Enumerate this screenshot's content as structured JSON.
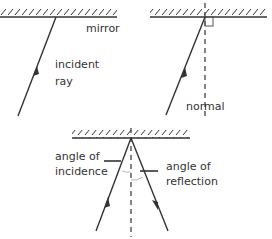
{
  "diagram": {
    "panel1": {
      "mirror_label": "mirror",
      "ray_label_line1": "incident",
      "ray_label_line2": "ray"
    },
    "panel2": {
      "normal_label": "normal"
    },
    "panel3": {
      "incidence_label_line1": "angle of",
      "incidence_label_line2": "incidence",
      "reflection_label_line1": "angle of",
      "reflection_label_line2": "reflection"
    },
    "colors": {
      "line": "#333333",
      "hatch": "#333333",
      "arc": "#bbbbbb",
      "background": "#ffffff"
    }
  }
}
